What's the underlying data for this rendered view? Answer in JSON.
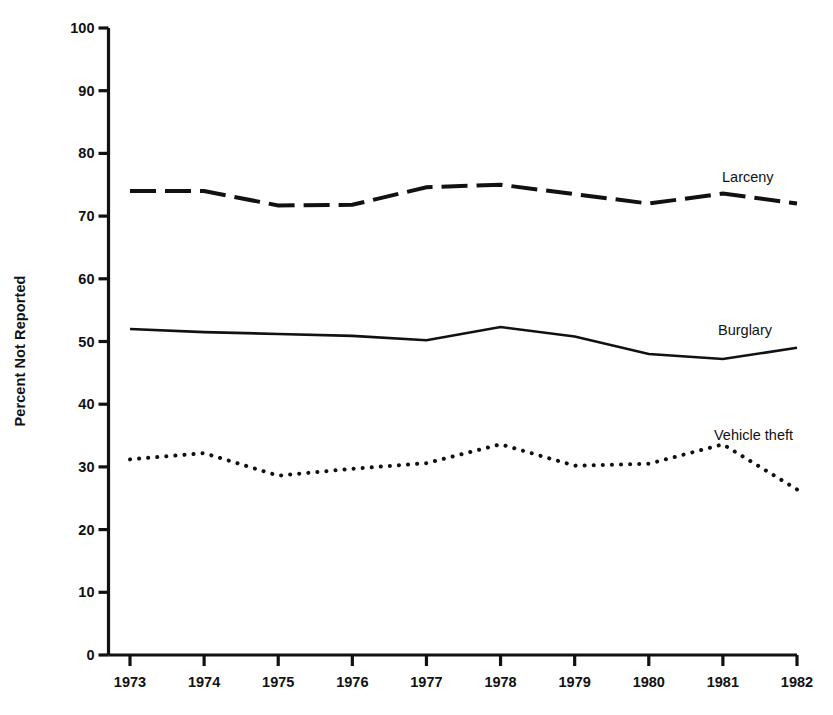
{
  "chart_data": {
    "type": "line",
    "title": "",
    "subtitle": "",
    "xlabel": "",
    "ylabel": "Percent Not Reported",
    "categories": [
      "1973",
      "1974",
      "1975",
      "1976",
      "1977",
      "1978",
      "1979",
      "1980",
      "1981",
      "1982"
    ],
    "x": [
      1973,
      1974,
      1975,
      1976,
      1977,
      1978,
      1979,
      1980,
      1981,
      1982
    ],
    "xlim": [
      1973,
      1982
    ],
    "ylim": [
      0,
      100
    ],
    "yticks": [
      0,
      10,
      20,
      30,
      40,
      50,
      60,
      70,
      80,
      90,
      100
    ],
    "ytick_labels": [
      "0",
      "10",
      "20",
      "30",
      "40",
      "50",
      "60",
      "70",
      "80",
      "90",
      "100"
    ],
    "grid": false,
    "legend_position": "inline-right-of-series",
    "series": [
      {
        "name": "Larceny",
        "linestyle": "dashed",
        "color": "#111111",
        "linewidth": 4,
        "label_anchor_year": 1981,
        "values": [
          74.0,
          74.0,
          71.7,
          71.8,
          74.6,
          75.0,
          73.5,
          72.0,
          73.6,
          72.0
        ]
      },
      {
        "name": "Burglary",
        "linestyle": "solid",
        "color": "#111111",
        "linewidth": 2.6,
        "label_anchor_year": 1981,
        "values": [
          52.0,
          51.5,
          51.2,
          50.9,
          50.2,
          52.3,
          50.8,
          48.0,
          47.2,
          49.0
        ]
      },
      {
        "name": "Vehicle theft",
        "linestyle": "dotted",
        "color": "#111111",
        "linewidth": 4,
        "label_anchor_year": 1981,
        "values": [
          31.2,
          32.2,
          28.6,
          29.7,
          30.6,
          33.6,
          30.2,
          30.5,
          33.6,
          26.4
        ]
      }
    ],
    "annotations": [
      {
        "text": "Larceny",
        "x": 722,
        "y": 170
      },
      {
        "text": "Burglary",
        "x": 718,
        "y": 323
      },
      {
        "text": "Vehicle theft",
        "x": 714,
        "y": 428
      }
    ]
  },
  "axis": {
    "y_title": "Percent Not Reported"
  }
}
